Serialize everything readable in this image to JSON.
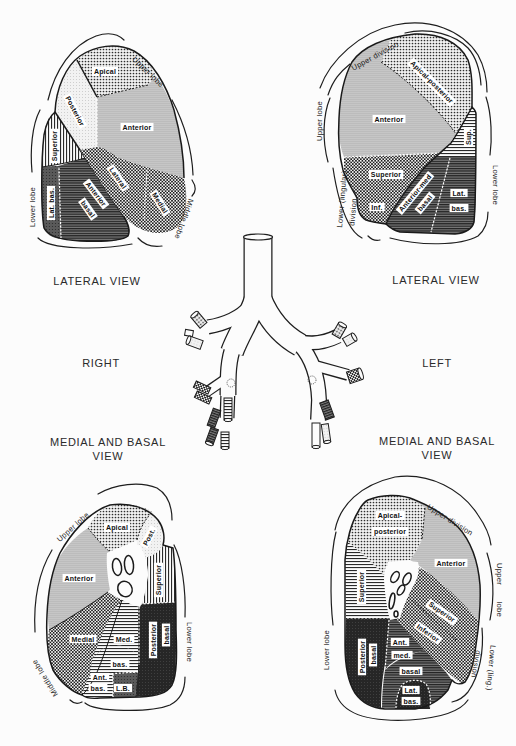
{
  "figure": {
    "side_labels": {
      "right": "RIGHT",
      "left": "LEFT"
    },
    "captions": {
      "right_lateral": "LATERAL VIEW",
      "left_lateral": "LATERAL VIEW",
      "right_medial_basal": [
        "MEDIAL AND BASAL",
        "VIEW"
      ],
      "left_medial_basal": [
        "MEDIAL AND BASAL",
        "VIEW"
      ]
    }
  },
  "panels": {
    "right_lateral": {
      "lobes": {
        "upper": "Upper lobe",
        "middle": "Middle lobe",
        "lower": "Lower lobe"
      },
      "segments": {
        "apical": "Apical",
        "posterior": "Posterior",
        "anterior": "Anterior",
        "lateral": "Lateral",
        "medial": "Medial",
        "superior": "Superior",
        "lateral_basal": "Lat. bas.",
        "anterior_basal": [
          "Anterior",
          "basal"
        ]
      }
    },
    "left_lateral": {
      "lobes": {
        "upper_division": "Upper division",
        "upper": "Upper lobe",
        "lingular_division": [
          "Lower (lingular)",
          "division"
        ],
        "lower": "Lower lobe"
      },
      "segments": {
        "apical_posterior": "Apical-posterior",
        "anterior": "Anterior",
        "superior_lingular": "Superior",
        "inferior_lingular": "Inf.",
        "superior": "Sup.",
        "anterior_medial_basal": [
          "Anterior-med",
          "basal"
        ],
        "lateral_basal": [
          "Lat.",
          "bas."
        ]
      }
    },
    "right_medial_basal": {
      "lobes": {
        "upper": "Upper lobe",
        "middle": "Middle lobe",
        "lower": "Lower lobe"
      },
      "segments": {
        "apical": "Apical",
        "posterior": "Post.",
        "anterior": "Anterior",
        "superior": "Superior",
        "medial": "Medial",
        "medial_basal": "Med.",
        "posterior_basal": [
          "Posterior",
          "basal"
        ],
        "basal": "bas.",
        "anterior_basal": [
          "Ant.",
          "bas."
        ],
        "lateral_basal": "L.B."
      }
    },
    "left_medial_basal": {
      "lobes": {
        "upper_division": "Upper division",
        "upper": "Upper lobe",
        "lingular_division": [
          "Lower (ling.)",
          "division"
        ],
        "lower": "Lower lobe"
      },
      "segments": {
        "apical_posterior": [
          "Apical-",
          "posterior"
        ],
        "anterior": "Anterior",
        "superior": "Superior",
        "superior_lingular": "Superior",
        "inferior_lingular": "Inferior",
        "posterior_basal": [
          "Posterior",
          "basal"
        ],
        "anterior_medial_basal": [
          "Ant.",
          "med."
        ],
        "basal": "basal",
        "lateral_basal": [
          "Lat.",
          "bas."
        ]
      }
    }
  },
  "colors": {
    "paper": "#fcfcfc",
    "ink": "#1a1a1a",
    "label_box": "#ffffff",
    "dark_fill": "#262626"
  }
}
